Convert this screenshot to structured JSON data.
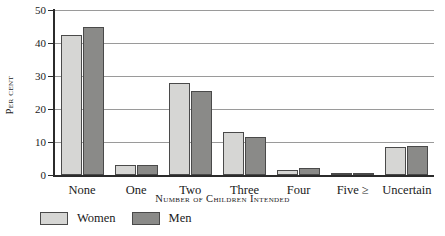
{
  "chart_data": {
    "type": "bar",
    "title": "",
    "xlabel": "Number of Children Intended",
    "ylabel": "Per cent",
    "categories": [
      "None",
      "One",
      "Two",
      "Three",
      "Four",
      "Five ≥",
      "Uncertain"
    ],
    "series": [
      {
        "name": "Women",
        "color": "#d6d6d4",
        "values": [
          42.5,
          3.0,
          28.0,
          13.0,
          1.5,
          0.3,
          8.5
        ]
      },
      {
        "name": "Men",
        "color": "#8a8a88",
        "values": [
          45.0,
          3.0,
          25.5,
          11.5,
          2.2,
          0.6,
          8.8
        ]
      }
    ],
    "ylim": [
      0,
      50
    ],
    "yticks": [
      0,
      10,
      20,
      30,
      40,
      50
    ],
    "ytick_labels": [
      "0",
      "10",
      "20",
      "30",
      "40",
      "50"
    ],
    "grid": true,
    "legend_position": "bottom-left"
  },
  "legend": {
    "items": [
      {
        "label": "Women"
      },
      {
        "label": "Men"
      }
    ]
  }
}
